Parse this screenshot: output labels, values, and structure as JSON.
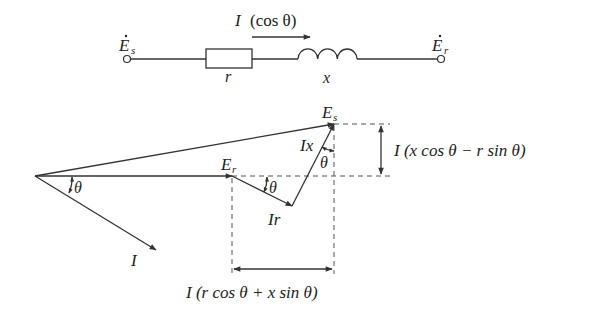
{
  "circuit": {
    "source_label": "E",
    "source_sub": "s",
    "receiver_label": "E",
    "receiver_sub": "r",
    "resistor_label": "r",
    "inductor_label": "x",
    "current_label": "I",
    "current_note": "(cos θ)"
  },
  "phasor": {
    "es_label": "E",
    "es_sub": "s",
    "er_label": "E",
    "er_sub": "r",
    "i_label": "I",
    "ir_label": "Ir",
    "ix_label": "Ix",
    "theta": "θ",
    "vertical_dim_label": "I (x cos θ − r sin θ)",
    "horizontal_dim_label": "I (r cos θ + x sin θ)"
  }
}
